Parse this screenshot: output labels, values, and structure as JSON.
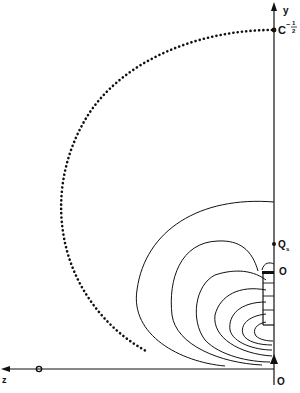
{
  "diagram": {
    "axes": {
      "y_label": "y",
      "z_label": "z"
    },
    "points": {
      "top_label": "C",
      "top_exponent_sign": "−",
      "top_exponent_num": "1",
      "top_exponent_den": "2",
      "qs_label": "Q",
      "qs_sub": "s",
      "mid_origin_label": "O",
      "bottom_origin_label": "O",
      "z_axis_origin_label": "O"
    },
    "colors": {
      "line": "#111111",
      "background": "#ffffff"
    }
  }
}
